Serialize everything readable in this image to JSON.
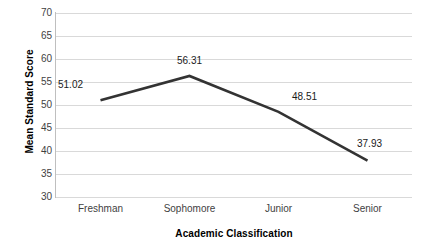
{
  "chart_data": {
    "type": "line",
    "title": "",
    "xlabel": "Academic Classification",
    "ylabel": "Mean Standard Score",
    "categories": [
      "Freshman",
      "Sophomore",
      "Junior",
      "Senior"
    ],
    "values": [
      51.02,
      56.31,
      48.51,
      37.93
    ],
    "point_labels": [
      "51.02",
      "56.31",
      "48.51",
      "37.93"
    ],
    "ylim": [
      30,
      70
    ],
    "yticks": [
      30,
      35,
      40,
      45,
      50,
      55,
      60,
      65,
      70
    ],
    "ytick_labels": [
      "30",
      "35",
      "40",
      "45",
      "50",
      "55",
      "60",
      "65",
      "70"
    ],
    "grid": "horizontal",
    "legend": "none",
    "series_color": "#333333",
    "gridline_color": "#d9d9d9",
    "axis_color": "#bfbfbf"
  },
  "axes": {
    "y_title": "Mean Standard Score",
    "x_title": "Academic Classification"
  },
  "ticks": {
    "y": [
      "70",
      "65",
      "60",
      "55",
      "50",
      "45",
      "40",
      "35",
      "30"
    ],
    "x": [
      "Freshman",
      "Sophomore",
      "Junior",
      "Senior"
    ]
  },
  "labels": {
    "p0": "51.02",
    "p1": "56.31",
    "p2": "48.51",
    "p3": "37.93"
  }
}
